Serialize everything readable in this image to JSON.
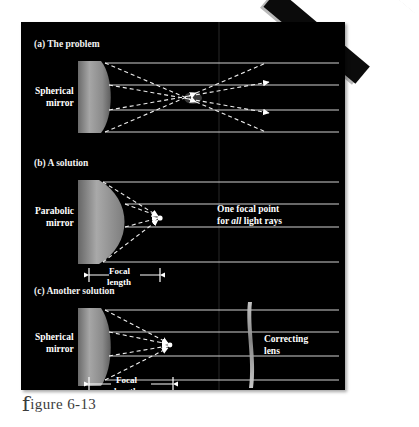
{
  "figure": {
    "caption_lead": "f",
    "caption_rest": "igure 6-13",
    "background_color": "#ffffff",
    "plate_color": "#000000"
  },
  "panels": [
    {
      "id": "a",
      "heading": "(a) The problem",
      "mirror_label_line1": "Spherical",
      "mirror_label_line2": "mirror",
      "focal_length_label_line1": "",
      "focal_length_label_line2": ""
    },
    {
      "id": "b",
      "heading": "(b) A solution",
      "mirror_label_line1": "Parabolic",
      "mirror_label_line2": "mirror",
      "note_line1": "One focal point",
      "note_line2_a": "for ",
      "note_line2_em": "all",
      "note_line2_b": " light rays",
      "focal_length_label_line1": "Focal",
      "focal_length_label_line2": "length"
    },
    {
      "id": "c",
      "heading": "(c) Another solution",
      "mirror_label_line1": "Spherical",
      "mirror_label_line2": "mirror",
      "lens_label_line1": "Correcting",
      "lens_label_line2": "lens",
      "focal_length_label_line1": "Focal",
      "focal_length_label_line2": "length"
    }
  ],
  "colors": {
    "ray_line": "#d8d8d8",
    "dashed_ray": "#f0f0f0",
    "mirror_body": "#8d8d8d",
    "lens_body": "#9a9a9a",
    "text": "#ffffff",
    "caption_text": "#3c3c3c"
  }
}
